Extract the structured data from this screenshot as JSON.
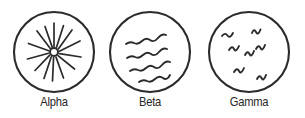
{
  "figure": {
    "title": "",
    "background_color": "#ffffff",
    "stroke_color": "#2b2b2b",
    "label_color": "#272727"
  },
  "panels": [
    {
      "id": "alpha",
      "label": "Alpha",
      "pattern": "sunburst-radiating-lines",
      "pattern_description": "small open circle at center with radiating straight rays",
      "center_ring_radius": 4,
      "ray_count": 13,
      "circle_radius": 40
    },
    {
      "id": "beta",
      "label": "Beta",
      "pattern": "diagonal-wavy-lines",
      "pattern_description": "four long wavy lines running lower-left to upper-right",
      "line_count": 4,
      "circle_radius": 40
    },
    {
      "id": "gamma",
      "label": "Gamma",
      "pattern": "scattered-squiggles",
      "pattern_description": "seven short scattered squiggle marks",
      "squiggle_count": 7,
      "circle_radius": 40
    }
  ]
}
